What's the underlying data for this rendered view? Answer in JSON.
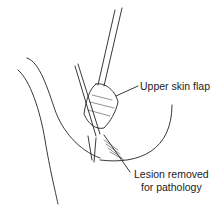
{
  "figure": {
    "labels": {
      "upper_flap": "Upper skin flap",
      "lesion_line1": "Lesion removed",
      "lesion_line2": "for pathology"
    }
  }
}
